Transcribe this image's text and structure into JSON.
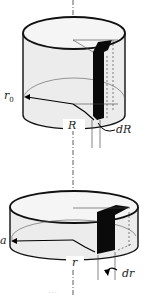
{
  "figure": {
    "top_cylinder": {
      "labels": {
        "outer_radius": "r",
        "outer_radius_sub": "0",
        "radius": "R",
        "thickness": "dR"
      }
    },
    "bottom_cylinder": {
      "labels": {
        "outer_radius": "a",
        "radius": "r",
        "thickness": "dr"
      }
    },
    "caption": "..."
  }
}
